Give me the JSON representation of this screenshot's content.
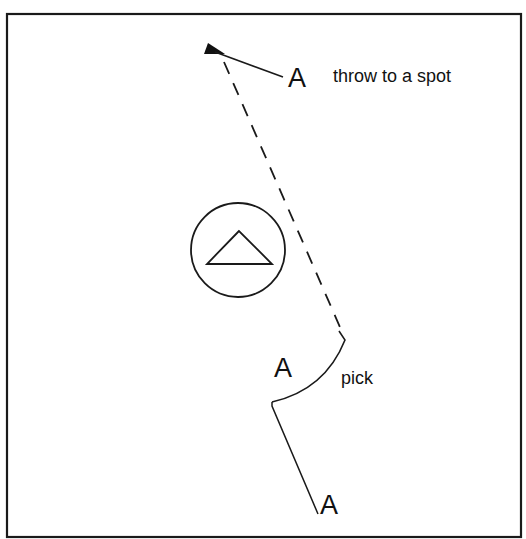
{
  "diagram": {
    "colors": {
      "ink": "#1a1a1a",
      "background": "#ffffff"
    },
    "labels": {
      "player_top": "A",
      "throw_note": "throw to a spot",
      "player_middle": "A",
      "pick_note": "pick",
      "player_bottom": "A"
    },
    "elements": {
      "frame": "field-border",
      "defender": "triangle-in-circle",
      "throw_path": "dashed-line",
      "runner_path": "solid-line",
      "pick_curve": "curved-line",
      "thrower_marker": "filled-wedge"
    }
  }
}
